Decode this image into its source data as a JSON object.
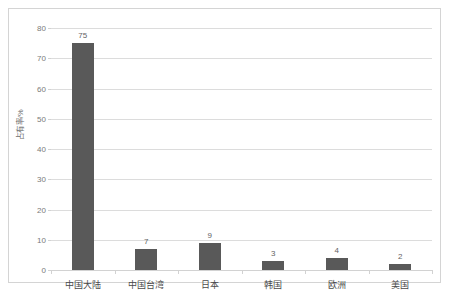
{
  "chart_data": {
    "type": "bar",
    "title": "",
    "subtitle": "",
    "xlabel": "",
    "ylabel": "占有率/%",
    "categories": [
      "中国大陆",
      "中国台湾",
      "日本",
      "韩国",
      "欧洲",
      "美国"
    ],
    "values": [
      75,
      7,
      9,
      3,
      4,
      2
    ],
    "data_labels": [
      "75",
      "7",
      "9",
      "3",
      "4",
      "2"
    ],
    "ylim": [
      0,
      80
    ],
    "ytick_labels": [
      "0",
      "10",
      "20",
      "30",
      "40",
      "50",
      "60",
      "70",
      "80"
    ],
    "ytick_values": [
      0,
      10,
      20,
      30,
      40,
      50,
      60,
      70,
      80
    ],
    "grid": "horizontal",
    "legend": "none",
    "series": [
      {
        "name": "占有率",
        "values": [
          75,
          7,
          9,
          3,
          4,
          2
        ],
        "color": "#595959"
      }
    ],
    "colors": {
      "bar": "#595959",
      "gridline": "#dcdcdc",
      "axis": "#d2d2d2",
      "tick_text": "#7a7a7a",
      "category_text": "#4a4a4a",
      "value_text": "#636363",
      "frame_border": "#d4d4d4",
      "background": "#ffffff"
    }
  }
}
